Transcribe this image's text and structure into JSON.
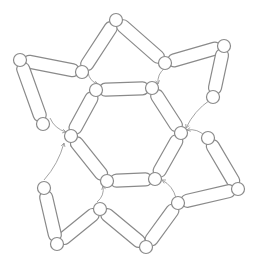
{
  "diagram": {
    "colors": {
      "background": "#ffffff",
      "stroke": "#8a8a8a",
      "arrow": "#9a9a9a"
    },
    "nodes": [
      {
        "id": "top-peak",
        "x": 116,
        "y": 20
      },
      {
        "id": "top-left-outer",
        "x": 20,
        "y": 60
      },
      {
        "id": "top-left-inner",
        "x": 82,
        "y": 72
      },
      {
        "id": "left-tail",
        "x": 43,
        "y": 124
      },
      {
        "id": "top-right-inner",
        "x": 165,
        "y": 63
      },
      {
        "id": "top-right-outer",
        "x": 224,
        "y": 46
      },
      {
        "id": "right-tail",
        "x": 213,
        "y": 97
      },
      {
        "id": "hex-tl",
        "x": 96,
        "y": 90
      },
      {
        "id": "hex-tr",
        "x": 152,
        "y": 88
      },
      {
        "id": "hex-r",
        "x": 181,
        "y": 133
      },
      {
        "id": "hex-br",
        "x": 155,
        "y": 179
      },
      {
        "id": "hex-bl",
        "x": 107,
        "y": 181
      },
      {
        "id": "hex-l",
        "x": 71,
        "y": 136
      },
      {
        "id": "right-top",
        "x": 208,
        "y": 138
      },
      {
        "id": "right-outer",
        "x": 238,
        "y": 189
      },
      {
        "id": "right-inner",
        "x": 178,
        "y": 203
      },
      {
        "id": "bottom-mid",
        "x": 146,
        "y": 247
      },
      {
        "id": "bottom-inner",
        "x": 100,
        "y": 209
      },
      {
        "id": "bottom-left",
        "x": 57,
        "y": 244
      },
      {
        "id": "left-bottom-tail",
        "x": 44,
        "y": 188
      }
    ],
    "links": [
      [
        "top-peak",
        "top-left-inner"
      ],
      [
        "top-peak",
        "top-right-inner"
      ],
      [
        "top-left-outer",
        "top-left-inner"
      ],
      [
        "top-left-outer",
        "left-tail"
      ],
      [
        "top-right-inner",
        "top-right-outer"
      ],
      [
        "top-right-outer",
        "right-tail"
      ],
      [
        "hex-tl",
        "hex-tr"
      ],
      [
        "hex-tr",
        "hex-r"
      ],
      [
        "hex-r",
        "hex-br"
      ],
      [
        "hex-br",
        "hex-bl"
      ],
      [
        "hex-bl",
        "hex-l"
      ],
      [
        "hex-l",
        "hex-tl"
      ],
      [
        "right-top",
        "right-outer"
      ],
      [
        "right-outer",
        "right-inner"
      ],
      [
        "right-inner",
        "bottom-mid"
      ],
      [
        "bottom-mid",
        "bottom-inner"
      ],
      [
        "bottom-inner",
        "bottom-left"
      ],
      [
        "bottom-left",
        "left-bottom-tail"
      ]
    ],
    "arrows": [
      {
        "from": [
          88,
          72
        ],
        "to": [
          98,
          84
        ]
      },
      {
        "from": [
          165,
          68
        ],
        "to": [
          158,
          84
        ]
      },
      {
        "from": [
          50,
          118
        ],
        "to": [
          66,
          132
        ]
      },
      {
        "from": [
          210,
          100
        ],
        "to": [
          186,
          128
        ]
      },
      {
        "from": [
          44,
          180
        ],
        "to": [
          64,
          143
        ]
      },
      {
        "from": [
          205,
          136
        ],
        "to": [
          187,
          130
        ]
      },
      {
        "from": [
          97,
          202
        ],
        "to": [
          103,
          186
        ]
      },
      {
        "from": [
          176,
          198
        ],
        "to": [
          162,
          180
        ]
      }
    ]
  }
}
